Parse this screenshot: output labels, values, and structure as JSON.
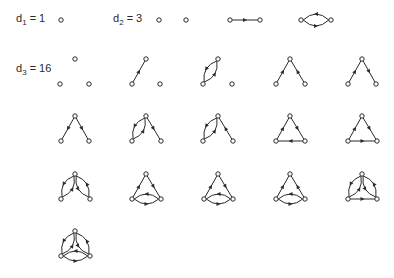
{
  "labels": [
    {
      "id": "d1",
      "base": "d",
      "sub": "1",
      "value": "= 1",
      "x": 16,
      "y": 12
    },
    {
      "id": "d2",
      "base": "d",
      "sub": "2",
      "value": "= 3",
      "x": 113,
      "y": 12
    },
    {
      "id": "d3",
      "base": "d",
      "sub": "3",
      "value": "= 16",
      "x": 16,
      "y": 62
    }
  ],
  "style": {
    "stroke": "#2a2a2a",
    "node_fill": "#ffffff",
    "node_r": 2.2
  },
  "graphs": [
    {
      "group": "d1",
      "nodes": [
        [
          61,
          20
        ]
      ],
      "edges": []
    },
    {
      "group": "d2",
      "nodes": [
        [
          159,
          20
        ],
        [
          186,
          20
        ]
      ],
      "edges": []
    },
    {
      "group": "d2",
      "nodes": [
        [
          230,
          20
        ],
        [
          260,
          20
        ]
      ],
      "edges": [
        {
          "from": 0,
          "to": 1,
          "bend": 0
        }
      ]
    },
    {
      "group": "d2",
      "nodes": [
        [
          301,
          20
        ],
        [
          331,
          20
        ]
      ],
      "edges": [
        {
          "from": 0,
          "to": 1,
          "bend": 6
        },
        {
          "from": 1,
          "to": 0,
          "bend": 6
        }
      ]
    },
    {
      "group": "d3",
      "nodes": [
        [
          75,
          59
        ],
        [
          60,
          84
        ],
        [
          89,
          84
        ]
      ],
      "edges": []
    },
    {
      "group": "d3",
      "nodes": [
        [
          146,
          59
        ],
        [
          132,
          84
        ],
        [
          160,
          84
        ]
      ],
      "edges": [
        {
          "from": 1,
          "to": 0,
          "bend": 0
        }
      ]
    },
    {
      "group": "d3",
      "nodes": [
        [
          218,
          59
        ],
        [
          203,
          84
        ],
        [
          232,
          84
        ]
      ],
      "edges": [
        {
          "from": 1,
          "to": 0,
          "bend": 5
        },
        {
          "from": 0,
          "to": 1,
          "bend": 5
        }
      ]
    },
    {
      "group": "d3",
      "nodes": [
        [
          290,
          59
        ],
        [
          276,
          84
        ],
        [
          305,
          84
        ]
      ],
      "edges": [
        {
          "from": 1,
          "to": 0,
          "bend": 0
        },
        {
          "from": 2,
          "to": 0,
          "bend": 0
        }
      ]
    },
    {
      "group": "d3",
      "nodes": [
        [
          362,
          59
        ],
        [
          348,
          84
        ],
        [
          376,
          84
        ]
      ],
      "edges": [
        {
          "from": 1,
          "to": 0,
          "bend": 0
        },
        {
          "from": 0,
          "to": 2,
          "bend": 0
        }
      ]
    },
    {
      "group": "d3",
      "nodes": [
        [
          75,
          116
        ],
        [
          61,
          141
        ],
        [
          89,
          141
        ]
      ],
      "edges": [
        {
          "from": 0,
          "to": 1,
          "bend": 0
        },
        {
          "from": 0,
          "to": 2,
          "bend": 0
        }
      ]
    },
    {
      "group": "d3",
      "nodes": [
        [
          146,
          116
        ],
        [
          132,
          141
        ],
        [
          161,
          141
        ]
      ],
      "edges": [
        {
          "from": 1,
          "to": 0,
          "bend": 5
        },
        {
          "from": 0,
          "to": 1,
          "bend": 5
        },
        {
          "from": 0,
          "to": 2,
          "bend": 0
        }
      ]
    },
    {
      "group": "d3",
      "nodes": [
        [
          218,
          116
        ],
        [
          203,
          141
        ],
        [
          233,
          141
        ]
      ],
      "edges": [
        {
          "from": 1,
          "to": 0,
          "bend": 5
        },
        {
          "from": 0,
          "to": 1,
          "bend": 5
        },
        {
          "from": 2,
          "to": 0,
          "bend": 0
        }
      ]
    },
    {
      "group": "d3",
      "nodes": [
        [
          290,
          116
        ],
        [
          276,
          141
        ],
        [
          305,
          141
        ]
      ],
      "edges": [
        {
          "from": 1,
          "to": 0,
          "bend": 0
        },
        {
          "from": 0,
          "to": 2,
          "bend": 0
        },
        {
          "from": 2,
          "to": 1,
          "bend": 0
        }
      ]
    },
    {
      "group": "d3",
      "nodes": [
        [
          362,
          116
        ],
        [
          348,
          141
        ],
        [
          377,
          141
        ]
      ],
      "edges": [
        {
          "from": 1,
          "to": 0,
          "bend": 0
        },
        {
          "from": 0,
          "to": 2,
          "bend": 0
        },
        {
          "from": 1,
          "to": 2,
          "bend": 0
        }
      ]
    },
    {
      "group": "d3",
      "nodes": [
        [
          75,
          174
        ],
        [
          61,
          199
        ],
        [
          90,
          199
        ]
      ],
      "edges": [
        {
          "from": 1,
          "to": 0,
          "bend": 5
        },
        {
          "from": 0,
          "to": 1,
          "bend": 5
        },
        {
          "from": 2,
          "to": 0,
          "bend": 5
        },
        {
          "from": 0,
          "to": 2,
          "bend": 5
        }
      ]
    },
    {
      "group": "d3",
      "nodes": [
        [
          146,
          174
        ],
        [
          132,
          199
        ],
        [
          161,
          199
        ]
      ],
      "edges": [
        {
          "from": 1,
          "to": 0,
          "bend": 0
        },
        {
          "from": 0,
          "to": 2,
          "bend": 0
        },
        {
          "from": 1,
          "to": 2,
          "bend": 5
        },
        {
          "from": 2,
          "to": 1,
          "bend": 5
        }
      ]
    },
    {
      "group": "d3",
      "nodes": [
        [
          218,
          174
        ],
        [
          204,
          199
        ],
        [
          233,
          199
        ]
      ],
      "edges": [
        {
          "from": 1,
          "to": 0,
          "bend": 0
        },
        {
          "from": 0,
          "to": 2,
          "bend": 0
        },
        {
          "from": 1,
          "to": 2,
          "bend": 5
        },
        {
          "from": 2,
          "to": 1,
          "bend": 5
        }
      ]
    },
    {
      "group": "d3",
      "nodes": [
        [
          290,
          174
        ],
        [
          276,
          199
        ],
        [
          305,
          199
        ]
      ],
      "edges": [
        {
          "from": 1,
          "to": 0,
          "bend": 0
        },
        {
          "from": 2,
          "to": 0,
          "bend": 0
        },
        {
          "from": 1,
          "to": 2,
          "bend": 5
        },
        {
          "from": 2,
          "to": 1,
          "bend": 5
        }
      ]
    },
    {
      "group": "d3",
      "nodes": [
        [
          362,
          174
        ],
        [
          348,
          199
        ],
        [
          377,
          199
        ]
      ],
      "edges": [
        {
          "from": 1,
          "to": 0,
          "bend": 5
        },
        {
          "from": 0,
          "to": 1,
          "bend": 5
        },
        {
          "from": 2,
          "to": 0,
          "bend": 5
        },
        {
          "from": 0,
          "to": 2,
          "bend": 5
        },
        {
          "from": 1,
          "to": 2,
          "bend": 0
        }
      ]
    },
    {
      "group": "d3",
      "nodes": [
        [
          75,
          231
        ],
        [
          61,
          256
        ],
        [
          90,
          256
        ]
      ],
      "edges": [
        {
          "from": 1,
          "to": 0,
          "bend": 5
        },
        {
          "from": 0,
          "to": 1,
          "bend": 5
        },
        {
          "from": 2,
          "to": 0,
          "bend": 5
        },
        {
          "from": 0,
          "to": 2,
          "bend": 5
        },
        {
          "from": 1,
          "to": 2,
          "bend": 5
        },
        {
          "from": 2,
          "to": 1,
          "bend": 5
        }
      ]
    }
  ]
}
